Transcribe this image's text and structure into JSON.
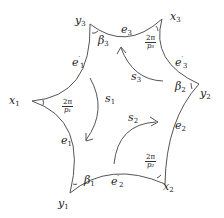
{
  "diagram": {
    "type": "hyperbolic-hexagon",
    "stroke_color": "#555555",
    "vertices": {
      "x1": {
        "label": "x",
        "sub": "1"
      },
      "x2": {
        "label": "x",
        "sub": "2"
      },
      "x3": {
        "label": "x",
        "sub": "3"
      },
      "y1": {
        "label": "y",
        "sub": "1"
      },
      "y2": {
        "label": "y",
        "sub": "2"
      },
      "y3": {
        "label": "y",
        "sub": "3"
      }
    },
    "edges": {
      "e1": {
        "label": "e",
        "sub": "1",
        "prime": ""
      },
      "e1p": {
        "label": "e",
        "sub": "1",
        "prime": "′"
      },
      "e2": {
        "label": "e",
        "sub": "2",
        "prime": ""
      },
      "e2p": {
        "label": "e",
        "sub": "2",
        "prime": "′"
      },
      "e3": {
        "label": "e",
        "sub": "3",
        "prime": ""
      },
      "e3p": {
        "label": "e",
        "sub": "3",
        "prime": "′"
      }
    },
    "angles": {
      "beta1": {
        "label": "β",
        "sub": "1"
      },
      "beta2": {
        "label": "β",
        "sub": "2"
      },
      "beta3": {
        "label": "β",
        "sub": "3"
      },
      "a1": {
        "num": "2π",
        "den": "p₁"
      },
      "a2": {
        "num": "2π",
        "den": "p₂"
      },
      "a3": {
        "num": "2π",
        "den": "p₃"
      }
    },
    "arrows": {
      "s1": {
        "label": "s",
        "sub": "1"
      },
      "s2": {
        "label": "s",
        "sub": "2"
      },
      "s3": {
        "label": "s",
        "sub": "3"
      }
    }
  }
}
